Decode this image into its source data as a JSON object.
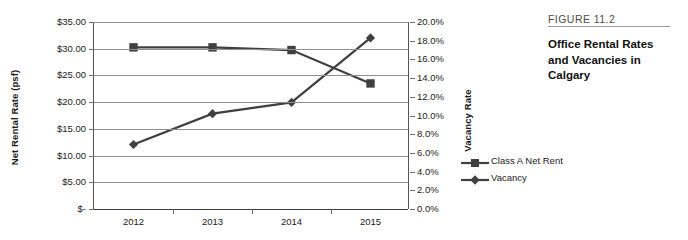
{
  "caption": {
    "figure_number": "FIGURE 11.2",
    "title": "Office Rental Rates and Vacancies in Calgary"
  },
  "legend": {
    "items": [
      {
        "label": "Class A Net Rent",
        "marker": "square",
        "color": "#404040"
      },
      {
        "label": "Vacancy",
        "marker": "diamond",
        "color": "#404040"
      }
    ]
  },
  "chart_data": {
    "type": "line",
    "title": "Office Rental Rates and Vacancies in Calgary",
    "xlabel": "",
    "categories": [
      "2012",
      "2013",
      "2014",
      "2015"
    ],
    "grid": true,
    "legend_position": "right",
    "axes": {
      "left": {
        "label": "Net Rental Rate (psf)",
        "min": 0,
        "max": 35,
        "step": 5,
        "tick_labels": [
          "$35.00",
          "$30.00",
          "$25.00",
          "$20.00",
          "$15.00",
          "$10.00",
          "$5.00",
          "$-"
        ]
      },
      "right": {
        "label": "Vacancy Rate",
        "min": 0,
        "max": 20,
        "step": 2,
        "tick_labels": [
          "20.0%",
          "18.0%",
          "16.0%",
          "14.0%",
          "12.0%",
          "10.0%",
          "8.0%",
          "6.0%",
          "4.0%",
          "2.0%",
          "0.0%"
        ]
      }
    },
    "series": [
      {
        "name": "Class A Net Rent",
        "axis": "left",
        "unit": "$/psf",
        "marker": "square",
        "color": "#404040",
        "values": [
          30.25,
          30.25,
          29.75,
          23.5
        ]
      },
      {
        "name": "Vacancy",
        "axis": "right",
        "unit": "%",
        "marker": "diamond",
        "color": "#404040",
        "values": [
          6.9,
          10.2,
          11.4,
          18.3
        ]
      }
    ]
  }
}
